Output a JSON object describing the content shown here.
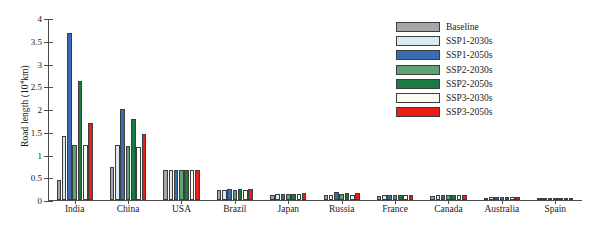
{
  "chart_data": {
    "type": "bar",
    "title": "",
    "xlabel": "",
    "ylabel": "Road length (10⁴km)",
    "ylabel_prefix": "Road length (10",
    "ylabel_exp": "4",
    "ylabel_suffix": "km)",
    "ylim": [
      0,
      4
    ],
    "yticks": [
      0,
      0.5,
      1,
      1.5,
      2,
      2.5,
      3,
      3.5,
      4
    ],
    "ytick_labels": [
      "0",
      "0.5",
      "1",
      "1.5",
      "2",
      "2.5",
      "3",
      "3.5",
      "4"
    ],
    "grid": false,
    "legend_position": "upper right",
    "categories": [
      "India",
      "China",
      "USA",
      "Brazil",
      "Japan",
      "Russia",
      "France",
      "Canada",
      "Australia",
      "Spain"
    ],
    "series": [
      {
        "name": "Baseline",
        "color": "#a6a6a6",
        "values": [
          0.45,
          0.72,
          0.65,
          0.21,
          0.12,
          0.1,
          0.09,
          0.09,
          0.05,
          0.04
        ]
      },
      {
        "name": "SSP1-2030s",
        "color": "#dbe9f1",
        "values": [
          1.4,
          1.22,
          0.66,
          0.22,
          0.13,
          0.12,
          0.1,
          0.1,
          0.06,
          0.05
        ]
      },
      {
        "name": "SSP1-2050s",
        "color": "#3a6cb4",
        "values": [
          3.66,
          2.01,
          0.66,
          0.24,
          0.14,
          0.18,
          0.11,
          0.12,
          0.07,
          0.05
        ]
      },
      {
        "name": "SSP2-2030s",
        "color": "#5fa373",
        "values": [
          1.22,
          1.18,
          0.66,
          0.23,
          0.13,
          0.13,
          0.1,
          0.1,
          0.06,
          0.05
        ]
      },
      {
        "name": "SSP2-2050s",
        "color": "#1a7a42",
        "values": [
          2.62,
          1.78,
          0.67,
          0.25,
          0.14,
          0.15,
          0.11,
          0.12,
          0.07,
          0.05
        ]
      },
      {
        "name": "SSP3-2030s",
        "color": "#fdfcf2",
        "values": [
          1.22,
          1.17,
          0.65,
          0.22,
          0.13,
          0.12,
          0.1,
          0.1,
          0.06,
          0.04
        ]
      },
      {
        "name": "SSP3-2050s",
        "color": "#e8201a",
        "values": [
          1.7,
          1.45,
          0.66,
          0.25,
          0.15,
          0.16,
          0.11,
          0.12,
          0.07,
          0.05
        ]
      }
    ]
  },
  "legend": {
    "items": [
      {
        "label": "Baseline",
        "color": "#a6a6a6"
      },
      {
        "label": "SSP1-2030s",
        "color": "#dbe9f1"
      },
      {
        "label": "SSP1-2050s",
        "color": "#3a6cb4"
      },
      {
        "label": "SSP2-2030s",
        "color": "#5fa373"
      },
      {
        "label": "SSP2-2050s",
        "color": "#1a7a42"
      },
      {
        "label": "SSP3-2030s",
        "color": "#fdfcf2"
      },
      {
        "label": "SSP3-2050s",
        "color": "#e8201a"
      }
    ]
  }
}
